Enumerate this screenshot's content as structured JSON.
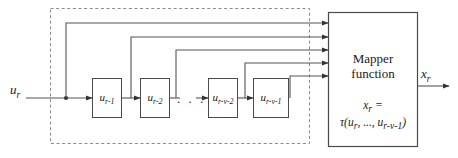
{
  "diagram": {
    "type": "block-diagram",
    "colors": {
      "line": "#555555",
      "box_border": "#4a4a4a",
      "dashed_border": "#8a8a8a",
      "text": "#1a1a1a",
      "background": "#ffffff"
    },
    "input": {
      "label_base": "u",
      "label_sub": "r",
      "label_full": "u_r"
    },
    "output": {
      "label_base": "x",
      "label_sub": "r",
      "label_full": "x_r"
    },
    "delay_blocks": [
      {
        "base": "u",
        "sub": "r-1",
        "full": "u_r-1"
      },
      {
        "base": "u",
        "sub": "r-2",
        "full": "u_r-2"
      },
      {
        "base": "u",
        "sub": "r-v-2",
        "full": "u_r-v-2"
      },
      {
        "base": "u",
        "sub": "r-v-1",
        "full": "u_r-v-1"
      }
    ],
    "ellipsis": ". . .",
    "mapper": {
      "title_line1": "Mapper",
      "title_line2": "function",
      "equation_line1_base": "x",
      "equation_line1_sub": "r",
      "equation_line1_tail": " =",
      "equation_line2_prefix": "τ(u",
      "equation_line2_sub1": "r",
      "equation_line2_mid": ", ..., u",
      "equation_line2_sub2": "r-v-1",
      "equation_line2_suffix": ")"
    },
    "feedback_arrow_count": 5
  }
}
